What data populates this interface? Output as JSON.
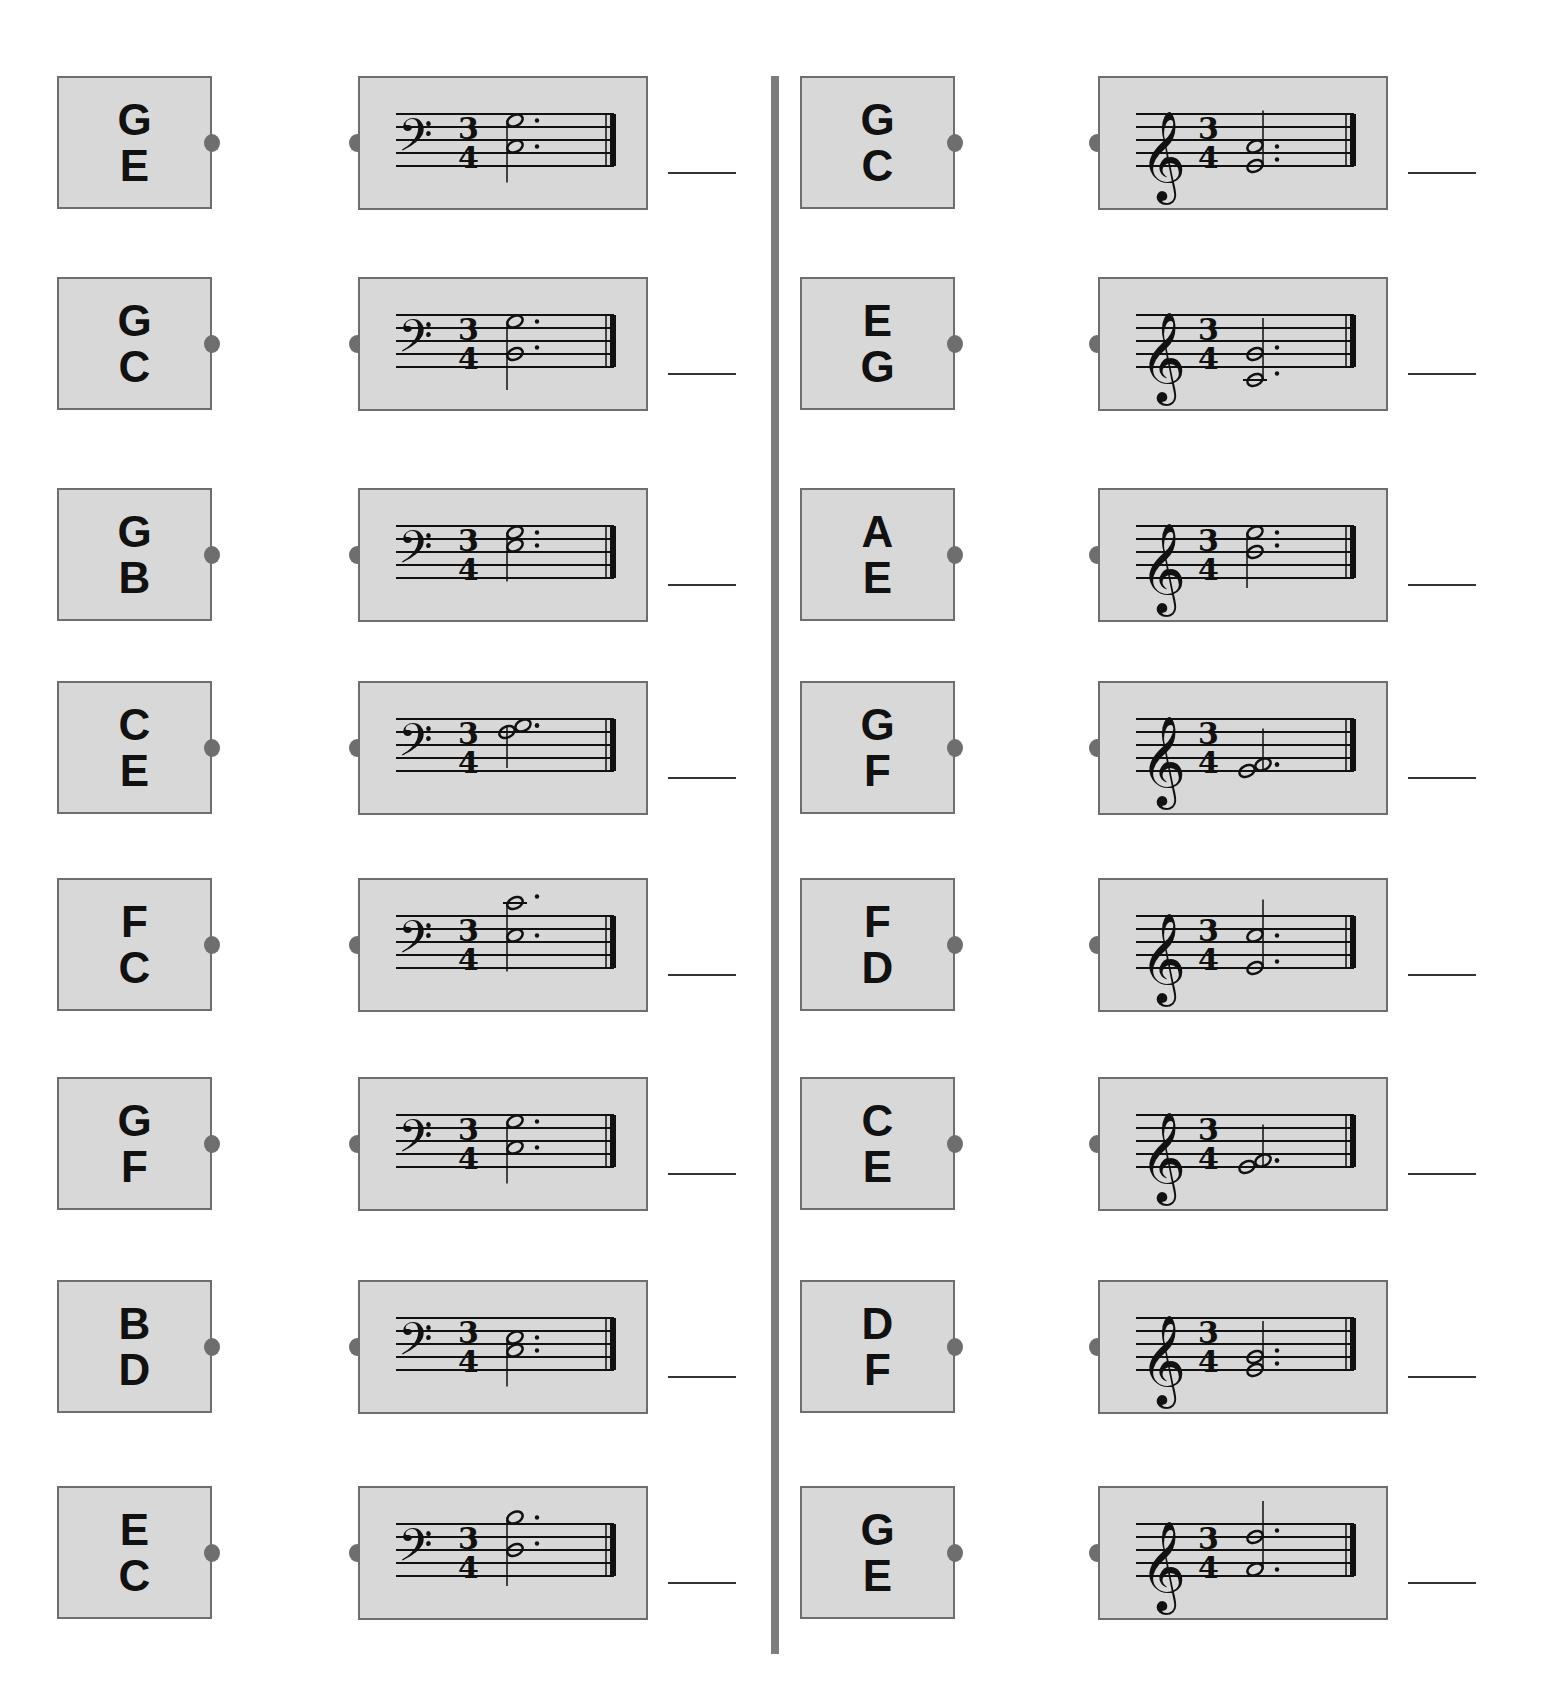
{
  "worksheet": {
    "instruction_partial": "",
    "left_column": {
      "clef": "bass",
      "time_signature": {
        "top": "3",
        "bottom": "4"
      },
      "rows": [
        {
          "top_letter": "G",
          "bottom_letter": "E",
          "notes": [
            "G3",
            "C3"
          ],
          "stem": "down"
        },
        {
          "top_letter": "G",
          "bottom_letter": "C",
          "notes": [
            "G3",
            "B2"
          ],
          "stem": "down"
        },
        {
          "top_letter": "G",
          "bottom_letter": "B",
          "notes": [
            "G3",
            "E3"
          ],
          "stem": "down"
        },
        {
          "top_letter": "C",
          "bottom_letter": "E",
          "notes": [
            "G3",
            "F3"
          ],
          "stem": "down"
        },
        {
          "top_letter": "F",
          "bottom_letter": "C",
          "notes": [
            "C4",
            "E3"
          ],
          "stem": "down"
        },
        {
          "top_letter": "G",
          "bottom_letter": "F",
          "notes": [
            "G3",
            "C3"
          ],
          "stem": "down"
        },
        {
          "top_letter": "B",
          "bottom_letter": "D",
          "notes": [
            "E3",
            "C3"
          ],
          "stem": "down"
        },
        {
          "top_letter": "E",
          "bottom_letter": "C",
          "notes": [
            "B3",
            "D3"
          ],
          "stem": "down"
        }
      ]
    },
    "right_column": {
      "clef": "treble",
      "time_signature": {
        "top": "3",
        "bottom": "4"
      },
      "rows": [
        {
          "top_letter": "G",
          "bottom_letter": "C",
          "notes": [
            "A4",
            "E4"
          ],
          "stem": "up"
        },
        {
          "top_letter": "E",
          "bottom_letter": "G",
          "notes": [
            "G4",
            "C4"
          ],
          "stem": "up"
        },
        {
          "top_letter": "A",
          "bottom_letter": "E",
          "notes": [
            "E5",
            "B4"
          ],
          "stem": "down"
        },
        {
          "top_letter": "G",
          "bottom_letter": "F",
          "notes": [
            "F4",
            "E4"
          ],
          "stem": "up"
        },
        {
          "top_letter": "F",
          "bottom_letter": "D",
          "notes": [
            "C5",
            "E4"
          ],
          "stem": "up"
        },
        {
          "top_letter": "C",
          "bottom_letter": "E",
          "notes": [
            "F4",
            "E4"
          ],
          "stem": "up"
        },
        {
          "top_letter": "D",
          "bottom_letter": "F",
          "notes": [
            "G4",
            "E4"
          ],
          "stem": "up"
        },
        {
          "top_letter": "G",
          "bottom_letter": "E",
          "notes": [
            "D5",
            "F4"
          ],
          "stem": "up"
        }
      ]
    },
    "colors": {
      "card_bg": "#d8d8d8",
      "card_border": "#6e6e6e",
      "divider": "#7d7d7d",
      "ink": "#111111"
    }
  }
}
